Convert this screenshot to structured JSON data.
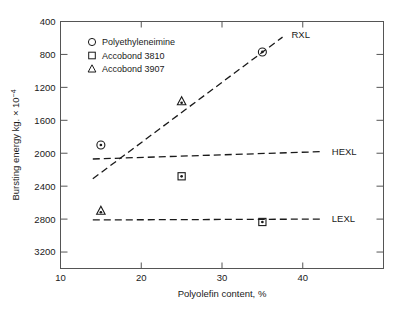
{
  "chart_data": {
    "type": "scatter",
    "title": "",
    "xlabel": "Polyolefin content, %",
    "ylabel": "Bursting energy kg. × 10⁻⁴",
    "xlim": [
      10,
      50
    ],
    "ylim": [
      200,
      3200
    ],
    "xticks": [
      10,
      20,
      30,
      40
    ],
    "yticks": [
      400,
      800,
      1200,
      1600,
      2000,
      2400,
      2800,
      3200
    ],
    "grid": false,
    "legend_position": "upper-left",
    "legend": [
      {
        "label": "Polyethyleneimine",
        "marker": "circle"
      },
      {
        "label": "Accobond 3810",
        "marker": "square"
      },
      {
        "label": "Accobond 3907",
        "marker": "triangle"
      }
    ],
    "series": [
      {
        "name": "Polyethyleneimine",
        "marker": "circle",
        "points": [
          {
            "x": 15,
            "y": 1700
          },
          {
            "x": 35,
            "y": 2830
          }
        ]
      },
      {
        "name": "Accobond 3810",
        "marker": "square",
        "points": [
          {
            "x": 25,
            "y": 1320
          },
          {
            "x": 35,
            "y": 765
          }
        ]
      },
      {
        "name": "Accobond 3907",
        "marker": "triangle",
        "points": [
          {
            "x": 15,
            "y": 900
          },
          {
            "x": 25,
            "y": 2230
          }
        ]
      }
    ],
    "trend_lines": [
      {
        "name": "RXL",
        "x0": 14,
        "y0": 1290,
        "x1": 37.5,
        "y1": 3010,
        "label": "RXL",
        "label_x": 38.6,
        "label_y": 3035
      },
      {
        "name": "HEXL",
        "x0": 14,
        "y0": 1530,
        "x1": 42.5,
        "y1": 1620,
        "label": "HEXL",
        "label_x": 43.6,
        "label_y": 1625
      },
      {
        "name": "LEXL",
        "x0": 14,
        "y0": 790,
        "x1": 42.5,
        "y1": 800,
        "label": "LEXL",
        "label_x": 43.6,
        "label_y": 805
      }
    ]
  },
  "axis": {
    "y_tick_labels": [
      "3200",
      "2800",
      "2400",
      "2000",
      "1600",
      "1200",
      "800",
      "400"
    ],
    "x_tick_labels": [
      "10",
      "20",
      "30",
      "40"
    ],
    "x_title": "Polyolefin content, %",
    "y_title": "Bursting energy kg. × 10",
    "y_title_exponent": "−4"
  },
  "colors": {
    "ink": "#1a1a1a",
    "frame": "#555555",
    "background": "#ffffff"
  }
}
